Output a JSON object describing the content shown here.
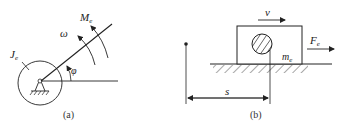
{
  "figure_a": {
    "caption": "(a)",
    "labels": {
      "J": "J",
      "J_sub": "e",
      "M": "M",
      "M_sub": "e",
      "omega": "ω",
      "phi": "φ"
    }
  },
  "figure_b": {
    "caption": "(b)",
    "labels": {
      "v": "v",
      "F": "F",
      "F_sub": "e",
      "m": "m",
      "m_sub": "e",
      "s": "s"
    }
  },
  "colors": {
    "stroke": "#222222",
    "background": "#ffffff"
  }
}
